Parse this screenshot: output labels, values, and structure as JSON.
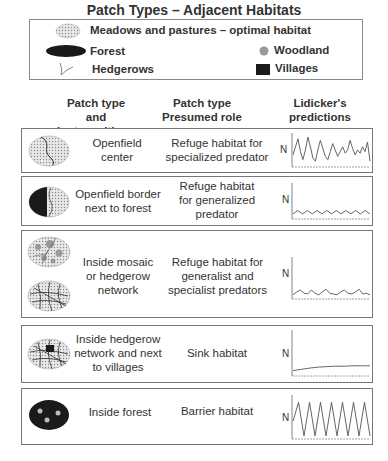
{
  "title": "Patch Types – Adjacent Habitats",
  "legend": {
    "items": [
      {
        "icon": "meadow-stipple-ellipse-icon",
        "label": "Meadows and pastures – optimal habitat"
      },
      {
        "icon": "forest-black-ellipse-icon",
        "label": "Forest"
      },
      {
        "icon": "woodland-gray-circle-icon",
        "label": "Woodland"
      },
      {
        "icon": "hedgerow-line-icon",
        "label": "Hedgerows"
      },
      {
        "icon": "village-black-square-icon",
        "label": "Villages"
      }
    ]
  },
  "columns": {
    "patch": "Patch type and juxtapositions",
    "role": "Patch type Presumed role",
    "predictions": "Lidicker's predictions"
  },
  "axis_label": "N",
  "colors": {
    "line": "#555555",
    "forest": "#1a1a1a",
    "border": "#777777"
  },
  "rows": [
    {
      "icon": "openfield-center-icon",
      "patch": "Openfield center",
      "role": "Refuge habitat for specialized predator",
      "prediction": "high irregular multiannual cycles"
    },
    {
      "icon": "openfield-border-forest-icon",
      "patch": "Openfield border next to forest",
      "role": "Refuge habitat for generalized predator",
      "prediction": "low regular seasonal fluctuations"
    },
    {
      "icon": "mosaic-hedgerow-network-icon",
      "patch": "Inside mosaic or hedgerow network",
      "role": "Refuge habitat for generalist and specialist predators",
      "prediction": "low irregular fluctuations"
    },
    {
      "icon": "hedgerow-village-icon",
      "patch": "Inside hedgerow network and next to villages",
      "role": "Sink habitat",
      "prediction": "low stable density"
    },
    {
      "icon": "inside-forest-icon",
      "patch": "Inside forest",
      "role": "Barrier habitat",
      "prediction": "regular high-amplitude cycles"
    }
  ],
  "chart_data": [
    {
      "type": "line",
      "title": "Openfield center",
      "ylabel": "N",
      "xlabel": "",
      "ylim": [
        0,
        1
      ],
      "values": [
        0.35,
        0.6,
        0.85,
        0.45,
        0.2,
        0.5,
        0.9,
        0.6,
        0.25,
        0.15,
        0.5,
        0.8,
        0.55,
        0.3,
        0.2,
        0.45,
        0.7,
        0.5,
        0.3,
        0.45,
        0.6,
        0.4,
        0.5,
        0.8,
        0.55,
        0.35,
        0.5,
        0.4,
        0.6,
        0.45,
        0.75,
        0.15
      ]
    },
    {
      "type": "line",
      "title": "Openfield border next to forest",
      "ylabel": "N",
      "xlabel": "",
      "ylim": [
        0,
        1
      ],
      "values": [
        0.12,
        0.22,
        0.12,
        0.22,
        0.12,
        0.22,
        0.12,
        0.22,
        0.12,
        0.22,
        0.12,
        0.22,
        0.12,
        0.22,
        0.12,
        0.22,
        0.12
      ]
    },
    {
      "type": "line",
      "title": "Inside mosaic or hedgerow network",
      "ylabel": "N",
      "xlabel": "",
      "ylim": [
        0,
        1
      ],
      "values": [
        0.08,
        0.15,
        0.2,
        0.12,
        0.1,
        0.2,
        0.12,
        0.08,
        0.15,
        0.22,
        0.12,
        0.1,
        0.08,
        0.15,
        0.2,
        0.12,
        0.1,
        0.15,
        0.22,
        0.1,
        0.12,
        0.08
      ]
    },
    {
      "type": "line",
      "title": "Inside hedgerow network and next to villages",
      "ylabel": "N",
      "xlabel": "",
      "ylim": [
        0,
        1
      ],
      "values": [
        0.1,
        0.13,
        0.16,
        0.18,
        0.19,
        0.2,
        0.2,
        0.21,
        0.21,
        0.21
      ]
    },
    {
      "type": "line",
      "title": "Inside forest",
      "ylabel": "N",
      "xlabel": "",
      "ylim": [
        0,
        1
      ],
      "values": [
        0.4,
        0.85,
        0.05,
        0.85,
        0.05,
        0.85,
        0.05,
        0.85,
        0.05,
        0.85,
        0.05,
        0.85,
        0.05,
        0.85,
        0.05
      ]
    }
  ]
}
